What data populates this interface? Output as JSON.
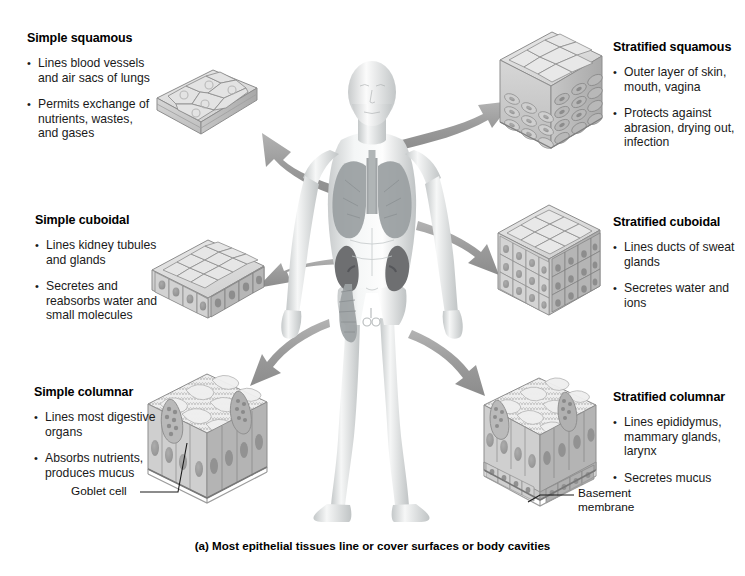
{
  "figure": {
    "caption": "(a) Most epithelial tissues line or cover surfaces or body cavities",
    "accent_gray": "#9a9a9a",
    "cell_fill": "#d9d9d9",
    "cell_stroke": "#8d8d8d"
  },
  "left_column": [
    {
      "id": "simple-squamous",
      "title": "Simple squamous",
      "bullets": [
        "Lines blood vessels\nand air sacs\nof lungs",
        "Permits exchange\nof nutrients, wastes,\nand gases"
      ]
    },
    {
      "id": "simple-cuboidal",
      "title": "Simple cuboidal",
      "bullets": [
        "Lines kidney\ntubules and glands",
        "Secretes and\nreabsorbs water\nand small molecules"
      ]
    },
    {
      "id": "simple-columnar",
      "title": "Simple columnar",
      "bullets": [
        "Lines most\ndigestive organs",
        "Absorbs nutrients,\nproduces mucus"
      ]
    }
  ],
  "right_column": [
    {
      "id": "stratified-squamous",
      "title": "Stratified squamous",
      "bullets": [
        "Outer layer of skin,\nmouth, vagina",
        "Protects against\nabrasion, drying\nout, infection"
      ]
    },
    {
      "id": "stratified-cuboidal",
      "title": "Stratified cuboidal",
      "bullets": [
        "Lines ducts of\nsweat glands",
        "Secretes water\nand ions"
      ]
    },
    {
      "id": "stratified-columnar",
      "title": "Stratified columnar",
      "bullets": [
        "Lines epididymus,\nmammary glands,\nlarynx",
        "Secretes mucus"
      ]
    }
  ],
  "callouts": {
    "goblet_cell": "Goblet  cell",
    "basement_membrane": "Basement\nmembrane"
  },
  "anatomy": {
    "figure_label": "human-body-anterior-view",
    "organs": [
      "lungs",
      "kidneys",
      "large-intestine"
    ]
  },
  "arrows": [
    {
      "id": "arrow-to-simple-squamous",
      "from": "body-upper-chest",
      "to": "simple-squamous-block"
    },
    {
      "id": "arrow-to-stratified-squamous",
      "from": "body-neck",
      "to": "stratified-squamous-block"
    },
    {
      "id": "arrow-to-simple-cuboidal",
      "from": "body-abdomen",
      "to": "simple-cuboidal-block"
    },
    {
      "id": "arrow-to-stratified-cuboidal",
      "from": "body-chest-right",
      "to": "stratified-cuboidal-block"
    },
    {
      "id": "arrow-to-simple-columnar",
      "from": "body-pelvis",
      "to": "simple-columnar-block"
    },
    {
      "id": "arrow-to-stratified-columnar",
      "from": "body-pelvis-right",
      "to": "stratified-columnar-block"
    }
  ]
}
